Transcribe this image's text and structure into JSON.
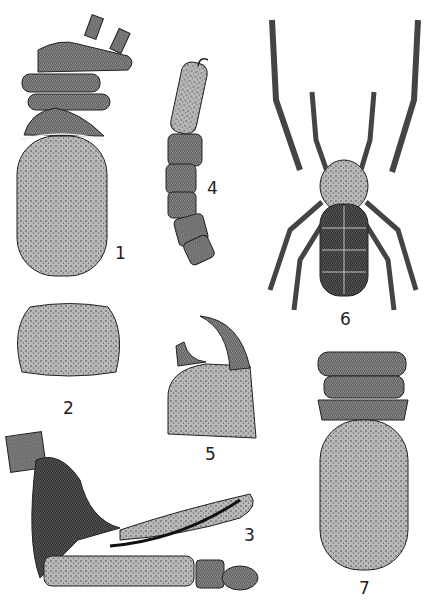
{
  "plate": {
    "background": "#ffffff",
    "ink_color": "#2a2a2a",
    "figures": [
      {
        "number": "1",
        "subject": "body dorsal view with cephalothorax and coxae"
      },
      {
        "number": "2",
        "subject": "dorsal scute plate"
      },
      {
        "number": "3",
        "subject": "pedipalp / genital apparatus lateral view"
      },
      {
        "number": "4",
        "subject": "segmented appendage"
      },
      {
        "number": "5",
        "subject": "chelicera claw"
      },
      {
        "number": "6",
        "subject": "whole animal dorsal habitus"
      },
      {
        "number": "7",
        "subject": "body ventral view"
      }
    ]
  },
  "labels": {
    "fig1": "1",
    "fig2": "2",
    "fig3": "3",
    "fig4": "4",
    "fig5": "5",
    "fig6": "6",
    "fig7": "7"
  }
}
